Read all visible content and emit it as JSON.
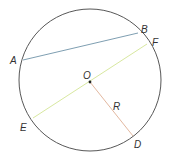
{
  "diagram": {
    "title": "",
    "points": {
      "A": "A",
      "B": "B",
      "F": "F",
      "O": "O",
      "E": "E",
      "D": "D"
    },
    "radius_label": "R",
    "colors": {
      "circle": "#444444",
      "chord_AB": "#6f93a8",
      "diameter_EF": "#d8e8a0",
      "radius_OD": "#e3b8a0",
      "center_dot": "#222222",
      "labels": "#333333"
    }
  }
}
